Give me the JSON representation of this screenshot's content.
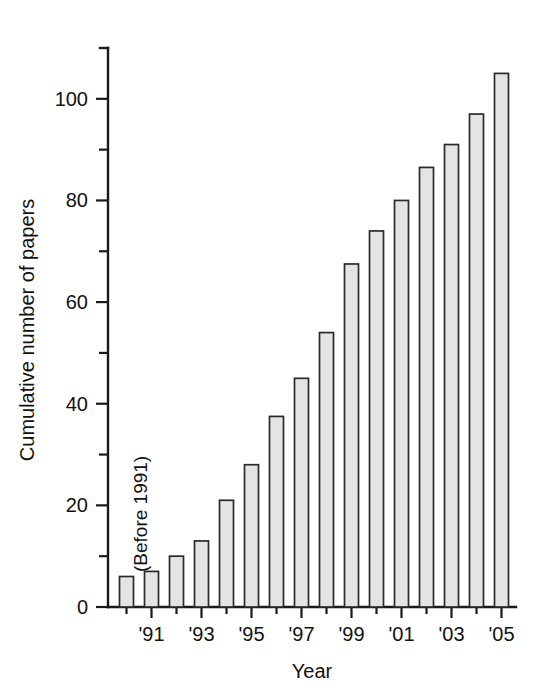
{
  "chart_data": {
    "type": "bar",
    "title": "",
    "xlabel": "Year",
    "ylabel": "Cumulative number of papers",
    "ylim": [
      0,
      110
    ],
    "yticks_major": [
      0,
      20,
      40,
      60,
      80,
      100
    ],
    "yticks_minor": [
      10,
      30,
      50,
      70,
      90
    ],
    "ytick_labels": [
      "0",
      "20",
      "40",
      "60",
      "80",
      "100"
    ],
    "grid": false,
    "legend": "none",
    "annotations": [
      {
        "text": "(Before 1991)",
        "orientation": "vertical",
        "target_category": "Before 1991"
      }
    ],
    "categories": [
      "Before 1991",
      "'91",
      "'92",
      "'93",
      "'94",
      "'95",
      "'96",
      "'97",
      "'98",
      "'99",
      "'00",
      "'01",
      "'02",
      "'03",
      "'04",
      "'05"
    ],
    "xtick_labels_shown": [
      "'91",
      "'93",
      "'95",
      "'97",
      "'99",
      "'01",
      "'03",
      "'05"
    ],
    "values": [
      6,
      7,
      10,
      13,
      21,
      28,
      37.5,
      45,
      54,
      67.5,
      74,
      80,
      86.5,
      91,
      97,
      105
    ],
    "bar_fill_color": "#e4e4e4",
    "bar_edge_color": "#2a2a2a",
    "axis_color": "#1a1a1a"
  }
}
